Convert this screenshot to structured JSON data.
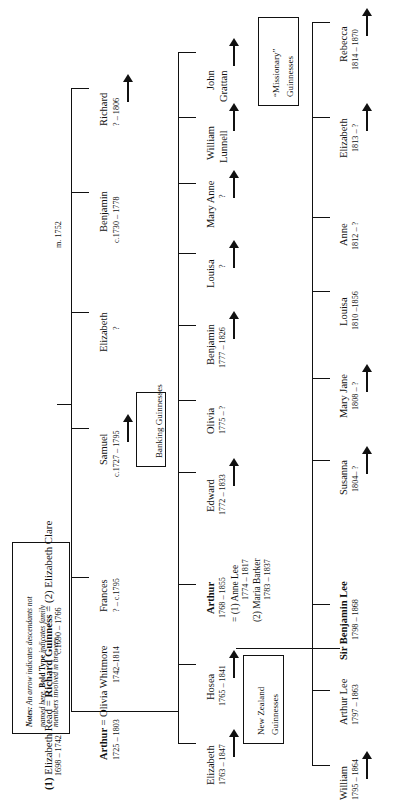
{
  "meta": {
    "orientation": "rotated-90-ccw",
    "ink_color": "#111111",
    "paper_color": "#ffffff"
  },
  "notes": {
    "label": "Notes:",
    "line1_a": "Notes:",
    "line1_b": " An arrow indicates descendants not",
    "line2_a": "named here. ",
    "line2_b": "Bold Type",
    "line2_c": " indicates family",
    "line3": "members involved in brewery."
  },
  "header": {
    "wife1_marker": "(1)",
    "wife1_name": "Elizabeth Read",
    "wife1_dates": "1698 – 1742",
    "equals": "=",
    "husband_name": "Richard Guinness",
    "husband_dates": "c.1690 – 1766",
    "wife2_marker": "(2)",
    "wife2_name": "Elizabeth Clare",
    "wife2_marriage": "m. 1752",
    "full_line": "(1) Elizabeth Read = Richard Guinness = (2) Elizabeth Clare"
  },
  "generation1": [
    {
      "name": "Arthur",
      "bold": true,
      "spouse": "= Olivia Whitmore",
      "dates": "1725 – 1803",
      "spouse_dates": "1742–1814",
      "arrow": false
    },
    {
      "name": "Frances",
      "bold": false,
      "spouse": "",
      "dates": "? – c.1795",
      "spouse_dates": "",
      "arrow": false
    },
    {
      "name": "Samuel",
      "bold": false,
      "spouse": "",
      "dates": "c.1727 – 1795",
      "spouse_dates": "",
      "arrow": true
    },
    {
      "name": "Elizabeth",
      "bold": false,
      "spouse": "",
      "dates": "?",
      "spouse_dates": "",
      "arrow": false
    },
    {
      "name": "Benjamin",
      "bold": false,
      "spouse": "",
      "dates": "c.1730 – 1778",
      "spouse_dates": "",
      "arrow": false
    },
    {
      "name": "Richard",
      "bold": false,
      "spouse": "",
      "dates": "? – 1806",
      "spouse_dates": "",
      "arrow": true
    }
  ],
  "generation2": [
    {
      "name": "Elizabeth",
      "bold": false,
      "dates": "1763 – 1847",
      "arrow": true
    },
    {
      "name": "Hosea",
      "bold": false,
      "dates": "1765 – 1841",
      "arrow": true
    },
    {
      "name": "Arthur",
      "bold": true,
      "dates": "1768 – 1855",
      "arrow": false,
      "marriage1_label": "= (1) Anne Lee",
      "marriage1_dates": "1774 – 1817",
      "marriage2_label": "(2) Maria Barker",
      "marriage2_dates": "1783 – 1837"
    },
    {
      "name": "Edward",
      "bold": false,
      "dates": "1772 – 1833",
      "arrow": true
    },
    {
      "name": "Olivia",
      "bold": false,
      "dates": "1775 – ?",
      "arrow": false
    },
    {
      "name": "Benjamin",
      "bold": false,
      "dates": "1777 – 1826",
      "arrow": true
    },
    {
      "name": "Louisa",
      "bold": false,
      "dates": "?",
      "arrow": true
    },
    {
      "name": "Mary Anne",
      "bold": false,
      "dates": "?",
      "arrow": true
    },
    {
      "name": "William",
      "name2": "Lunnell",
      "bold": false,
      "dates": "",
      "arrow": true
    },
    {
      "name": "John",
      "name2": "Grattan",
      "bold": false,
      "dates": "",
      "arrow": true
    }
  ],
  "generation3": [
    {
      "name": "William",
      "bold": false,
      "dates": "1795 – 1864",
      "arrow": true
    },
    {
      "name": "Arthur Lee",
      "bold": false,
      "dates": "1797 – 1863",
      "arrow": false
    },
    {
      "name": "Sir Benjamin Lee",
      "bold": true,
      "dates": "1798 – 1868",
      "arrow": false
    },
    {
      "name": "Susanna",
      "bold": false,
      "dates": "1804– ?",
      "arrow": true
    },
    {
      "name": "Mary Jane",
      "bold": false,
      "dates": "1808 – ?",
      "arrow": true
    },
    {
      "name": "Louisa",
      "bold": false,
      "dates": "1810 –1856",
      "arrow": false
    },
    {
      "name": "Anne",
      "bold": false,
      "dates": "1812 – ?",
      "arrow": false
    },
    {
      "name": "Elizabeth",
      "bold": false,
      "dates": "1813 – ?",
      "arrow": true
    },
    {
      "name": "Rebecca",
      "bold": false,
      "dates": "1814 – 1870",
      "arrow": true
    }
  ],
  "boxes": {
    "banking": {
      "line1": "Banking Guinnesses"
    },
    "new_zealand": {
      "line1": "New Zealand",
      "line2": "Guinnesses"
    },
    "missionary": {
      "line1": "“Missionary”",
      "line2": "Guinnesses"
    }
  }
}
